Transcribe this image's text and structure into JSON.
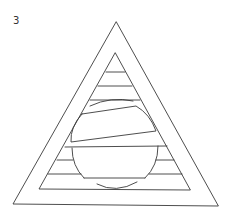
{
  "figure": {
    "label": "3",
    "stroke_color": "#3a3a3a",
    "background_color": "#ffffff"
  }
}
